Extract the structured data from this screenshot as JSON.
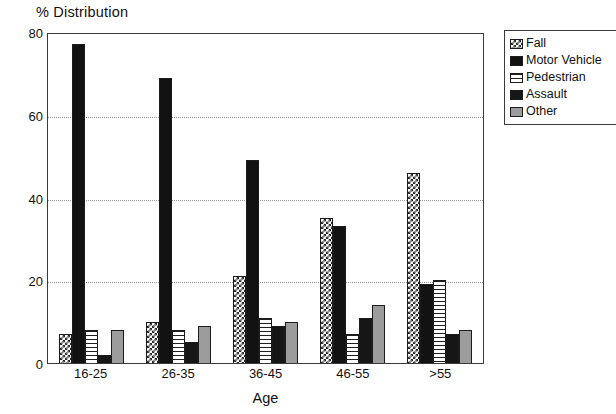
{
  "chart_data": {
    "type": "bar",
    "title": "% Distribution",
    "xlabel": "Age",
    "ylabel": "",
    "categories": [
      "16-25",
      "26-35",
      "36-45",
      "46-55",
      ">55"
    ],
    "ylim": [
      0,
      80
    ],
    "yticks": [
      0,
      20,
      40,
      60,
      80
    ],
    "grid": true,
    "legend_position": "right",
    "series": [
      {
        "name": "Fall",
        "pattern": "checkerboard",
        "values": [
          7,
          10,
          21,
          35,
          46
        ]
      },
      {
        "name": "Motor Vehicle",
        "pattern": "solid-black",
        "values": [
          77,
          69,
          49,
          33,
          19
        ]
      },
      {
        "name": "Pedestrian",
        "pattern": "horizontal-hatch",
        "values": [
          8,
          8,
          11,
          7,
          20
        ]
      },
      {
        "name": "Assault",
        "pattern": "solid-dark",
        "values": [
          2,
          5,
          9,
          11,
          7
        ]
      },
      {
        "name": "Other",
        "pattern": "gray-fill",
        "values": [
          8,
          9,
          10,
          14,
          8
        ]
      }
    ]
  },
  "colors": {
    "axis": "#3a3a3a",
    "grid": "#9a9a9a",
    "text": "#111111",
    "background": "#ffffff",
    "fall": "#2a2a2a",
    "motor_vehicle": "#121212",
    "pedestrian": "#1f1f1f",
    "assault": "#161616",
    "other": "#9c9c9c"
  }
}
